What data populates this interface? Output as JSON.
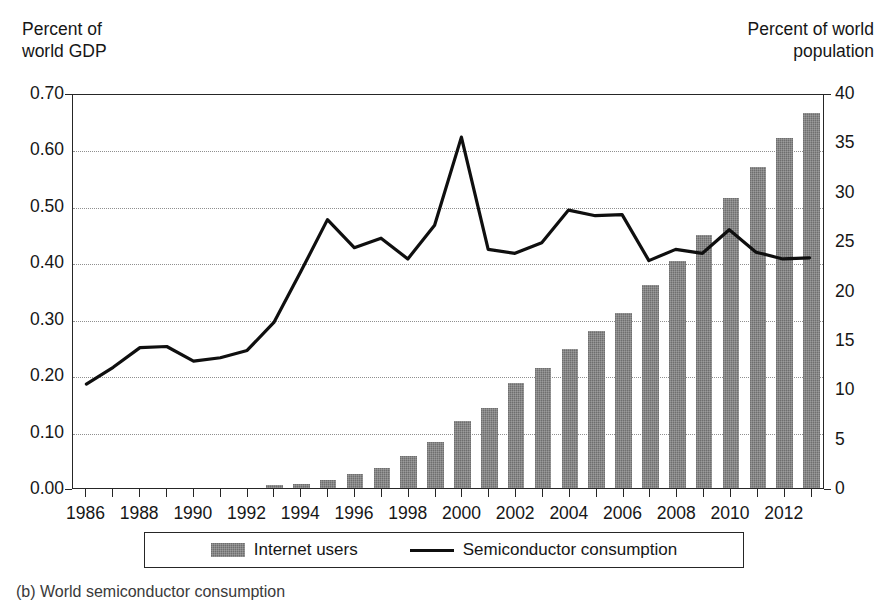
{
  "axes": {
    "y_left_title": "Percent of\nworld GDP",
    "y_right_title": "Percent of world\npopulation",
    "y_left_ticks": [
      "0.70",
      "0.60",
      "0.50",
      "0.40",
      "0.30",
      "0.20",
      "0.10",
      "0.00"
    ],
    "y_right_ticks": [
      "40",
      "35",
      "30",
      "25",
      "20",
      "15",
      "10",
      "5",
      "0"
    ],
    "x_ticks": [
      "1986",
      "1988",
      "1990",
      "1992",
      "1994",
      "1996",
      "1998",
      "2000",
      "2002",
      "2004",
      "2006",
      "2008",
      "2010",
      "2012"
    ]
  },
  "legend": {
    "bar_label": "Internet users",
    "line_label": "Semiconductor consumption"
  },
  "caption": "(b) World semiconductor consumption",
  "colors": {
    "bar_fill": "#7b7b7b",
    "line_stroke": "#0f0f0f",
    "frame": "#262626",
    "grid": "#8f8f8f"
  },
  "chart_data": {
    "type": "bar",
    "title": "",
    "xlabel": "",
    "grid": true,
    "legend_position": "bottom",
    "categories": [
      "1986",
      "1987",
      "1988",
      "1989",
      "1990",
      "1991",
      "1992",
      "1993",
      "1994",
      "1995",
      "1996",
      "1997",
      "1998",
      "1999",
      "2000",
      "2001",
      "2002",
      "2003",
      "2004",
      "2005",
      "2006",
      "2007",
      "2008",
      "2009",
      "2010",
      "2011",
      "2012",
      "2013"
    ],
    "series": [
      {
        "name": "Internet users",
        "type": "bar",
        "axis": "right",
        "ylabel": "Percent of world population",
        "ylim": [
          0,
          40
        ],
        "values": [
          0,
          0,
          0,
          0,
          0,
          0,
          0,
          0.3,
          0.4,
          0.8,
          1.4,
          2.0,
          3.2,
          4.7,
          6.8,
          8.1,
          10.6,
          12.2,
          14.1,
          15.9,
          17.7,
          20.6,
          23.0,
          25.6,
          29.4,
          32.5,
          35.4,
          38.0
        ]
      },
      {
        "name": "Semiconductor consumption",
        "type": "line",
        "axis": "left",
        "ylabel": "Percent of world GDP",
        "ylim": [
          0,
          0.7
        ],
        "values": [
          0.185,
          0.215,
          0.25,
          0.252,
          0.226,
          0.232,
          0.245,
          0.295,
          0.385,
          0.478,
          0.428,
          0.445,
          0.408,
          0.468,
          0.625,
          0.425,
          0.418,
          0.437,
          0.495,
          0.485,
          0.487,
          0.405,
          0.425,
          0.418,
          0.46,
          0.42,
          0.408,
          0.41
        ]
      }
    ]
  }
}
